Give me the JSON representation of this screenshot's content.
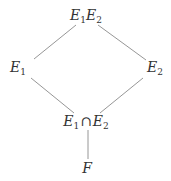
{
  "diagram": {
    "type": "hasse-lattice",
    "line_color": "#8a8a8a",
    "text_color": "#333333",
    "nodes": {
      "top": {
        "base1": "E",
        "sub1": "1",
        "base2": "E",
        "sub2": "2",
        "x": 86,
        "y": 16
      },
      "left": {
        "base": "E",
        "sub": "1",
        "x": 18,
        "y": 68
      },
      "right": {
        "base": "E",
        "sub": "2",
        "x": 155,
        "y": 68
      },
      "middle": {
        "base1": "E",
        "sub1": "1",
        "op": "∩",
        "base2": "E",
        "sub2": "2",
        "x": 86,
        "y": 122
      },
      "bottom": {
        "base": "F",
        "x": 87,
        "y": 168
      }
    },
    "edges": [
      {
        "from": "top",
        "to": "left"
      },
      {
        "from": "top",
        "to": "right"
      },
      {
        "from": "left",
        "to": "middle"
      },
      {
        "from": "right",
        "to": "middle"
      },
      {
        "from": "middle",
        "to": "bottom"
      }
    ]
  }
}
